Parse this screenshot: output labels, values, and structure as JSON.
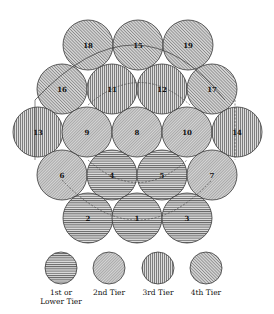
{
  "diagram": {
    "tiers": [
      {
        "id": 1,
        "label_lines": [
          "1st or",
          "Lower Tier"
        ],
        "pattern": "horizontal"
      },
      {
        "id": 2,
        "label_lines": [
          "2nd Tier"
        ],
        "pattern": "diagonal-fine"
      },
      {
        "id": 3,
        "label_lines": [
          "3rd Tier"
        ],
        "pattern": "vertical"
      },
      {
        "id": 4,
        "label_lines": [
          "4th Tier"
        ],
        "pattern": "diagonal"
      }
    ],
    "circles": [
      {
        "label": "18",
        "tier": 4
      },
      {
        "label": "15",
        "tier": 4
      },
      {
        "label": "19",
        "tier": 4
      },
      {
        "label": "16",
        "tier": 4
      },
      {
        "label": "11",
        "tier": 3
      },
      {
        "label": "12",
        "tier": 3
      },
      {
        "label": "17",
        "tier": 4
      },
      {
        "label": "13",
        "tier": 3
      },
      {
        "label": "9",
        "tier": 2
      },
      {
        "label": "8",
        "tier": 2
      },
      {
        "label": "10",
        "tier": 2
      },
      {
        "label": "14",
        "tier": 3
      },
      {
        "label": "6",
        "tier": 2
      },
      {
        "label": "4",
        "tier": 1
      },
      {
        "label": "5",
        "tier": 1
      },
      {
        "label": "7",
        "tier": 2
      },
      {
        "label": "2",
        "tier": 1
      },
      {
        "label": "1",
        "tier": 1
      },
      {
        "label": "3",
        "tier": 1
      }
    ],
    "colors": {
      "stroke": "#3a3a3a",
      "hatch": "#555555",
      "fill": "#d9d9d9",
      "background": "#ffffff"
    }
  }
}
